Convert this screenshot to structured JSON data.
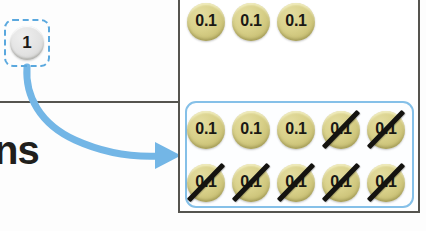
{
  "canvas": {
    "width": 426,
    "height": 231
  },
  "colors": {
    "accent_blue": "#85c0e8",
    "arrow_blue": "#73b6e6",
    "selection_dash_blue": "#5aa8de",
    "disc_fill": "#d8d089",
    "disc_edge": "#b6ae66",
    "token_fill": "#e2e2e2",
    "ink_black": "#1a1814",
    "panel_border": "#55544f"
  },
  "worksheet": {
    "cropped_word": "ns",
    "divider_visible": true
  },
  "drag_token": {
    "label": "1",
    "state": "selected",
    "selection_style": "dashed-rounded-box",
    "icon": "circle-token-icon"
  },
  "arrow": {
    "kind": "curved-arrow-icon",
    "direction": "down-right",
    "from": {
      "x": 28,
      "y": 68
    },
    "to": {
      "x": 180,
      "y": 155
    },
    "color": "#73b6e6"
  },
  "panel": {
    "top_row": {
      "label": "ungrouped-discs",
      "count": 3,
      "discs": [
        {
          "value": "0.1",
          "crossed_out": false
        },
        {
          "value": "0.1",
          "crossed_out": false
        },
        {
          "value": "0.1",
          "crossed_out": false
        }
      ]
    },
    "group": {
      "label": "highlighted-disc-group",
      "rows": 2,
      "columns": 5,
      "total": 10,
      "crossed_out_count": 7,
      "remaining_count": 3,
      "discs": [
        {
          "value": "0.1",
          "crossed_out": false,
          "row": 1,
          "col": 1
        },
        {
          "value": "0.1",
          "crossed_out": false,
          "row": 1,
          "col": 2
        },
        {
          "value": "0.1",
          "crossed_out": false,
          "row": 1,
          "col": 3
        },
        {
          "value": "0.1",
          "crossed_out": true,
          "row": 1,
          "col": 4
        },
        {
          "value": "0.1",
          "crossed_out": true,
          "row": 1,
          "col": 5
        },
        {
          "value": "0.1",
          "crossed_out": true,
          "row": 2,
          "col": 1
        },
        {
          "value": "0.1",
          "crossed_out": true,
          "row": 2,
          "col": 2
        },
        {
          "value": "0.1",
          "crossed_out": true,
          "row": 2,
          "col": 3
        },
        {
          "value": "0.1",
          "crossed_out": true,
          "row": 2,
          "col": 4
        },
        {
          "value": "0.1",
          "crossed_out": true,
          "row": 2,
          "col": 5
        }
      ]
    }
  },
  "layout": {
    "top_row_y": 3,
    "group_row1_y": 111,
    "group_row2_y": 164,
    "col_x": [
      187,
      232,
      277,
      322,
      367
    ]
  }
}
